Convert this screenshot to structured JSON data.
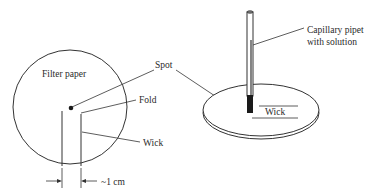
{
  "figure": {
    "left_panel": {
      "title": "Filter paper",
      "labels": {
        "spot": "Spot",
        "fold": "Fold",
        "wick": "Wick",
        "width": "~1 cm"
      }
    },
    "right_panel": {
      "labels": {
        "pipet_line1": "Capillary pipet",
        "pipet_line2": "with solution",
        "wick": "Wick"
      }
    },
    "colors": {
      "stroke": "#333333",
      "fill_dark": "#1a1a1a"
    }
  }
}
